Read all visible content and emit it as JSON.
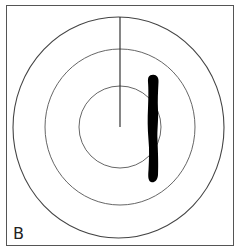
{
  "figure": {
    "panel_label": "B",
    "colors": {
      "ring_stroke": "#444444",
      "pointer_stroke": "#222222",
      "blob_fill": "#000000",
      "border": "#555555",
      "background": "#ffffff"
    },
    "rings": [
      {
        "name": "outer",
        "cx": 118.5,
        "cy": 127.5,
        "rx": 105.5,
        "ry": 110.5
      },
      {
        "name": "middle",
        "cx": 120,
        "cy": 127,
        "rx": 75,
        "ry": 78
      },
      {
        "name": "inner",
        "cx": 120,
        "cy": 127,
        "rx": 41,
        "ry": 41
      }
    ],
    "pointer_line": {
      "x": 120,
      "y1": 17,
      "y2": 127
    },
    "blob": {
      "x_range": [
        147,
        159
      ],
      "y_range": [
        75,
        182
      ]
    }
  }
}
